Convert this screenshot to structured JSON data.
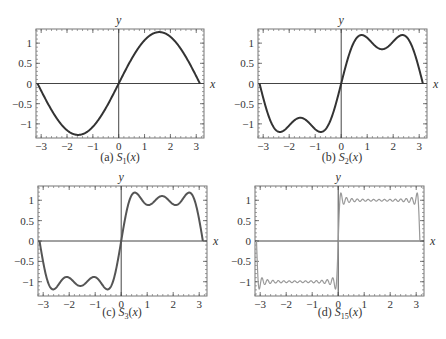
{
  "figure": {
    "panels": [
      {
        "id": "a",
        "caption_prefix": "(a) ",
        "func": "S",
        "sub": "1",
        "arg": "(x)"
      },
      {
        "id": "b",
        "caption_prefix": "(b) ",
        "func": "S",
        "sub": "2",
        "arg": "(x)"
      },
      {
        "id": "c",
        "caption_prefix": "(c) ",
        "func": "S",
        "sub": "3",
        "arg": "(x)"
      },
      {
        "id": "d",
        "caption_prefix": "(d) ",
        "func": "S",
        "sub": "15",
        "arg": "(x)"
      }
    ]
  },
  "chart_data": [
    {
      "type": "line",
      "title": "(a) S1(x)",
      "xlabel": "x",
      "ylabel": "y",
      "xlim": [
        -3.2,
        3.3
      ],
      "ylim": [
        -1.35,
        1.35
      ],
      "xticks": [
        -3,
        -2,
        -1,
        0,
        1,
        2,
        3
      ],
      "yticks": [
        -1,
        -0.5,
        0,
        0.5,
        1
      ],
      "ytick_labels": [
        "−1",
        "−0.5",
        "0",
        "0.5",
        "1"
      ],
      "xtick_labels": [
        "−3",
        "−2",
        "−1",
        "0",
        "1",
        "2",
        "3"
      ],
      "terms": 1,
      "formula": "(4/π) Σ_{k=1..n} sin((2k−1)x)/(2k−1)",
      "x_domain": [
        -3.14159,
        3.14159
      ],
      "key_points": [
        [
          -3.14,
          0
        ],
        [
          -1.57,
          -1.27
        ],
        [
          0,
          0
        ],
        [
          1.57,
          1.27
        ],
        [
          3.14,
          0
        ]
      ],
      "stroke": "#333333"
    },
    {
      "type": "line",
      "title": "(b) S2(x)",
      "xlabel": "x",
      "ylabel": "y",
      "xlim": [
        -3.2,
        3.3
      ],
      "ylim": [
        -1.35,
        1.35
      ],
      "xticks": [
        -3,
        -2,
        -1,
        0,
        1,
        2,
        3
      ],
      "yticks": [
        -1,
        -0.5,
        0,
        0.5,
        1
      ],
      "ytick_labels": [
        "−1",
        "−0.5",
        "0",
        "0.5",
        "1"
      ],
      "xtick_labels": [
        "−3",
        "−2",
        "−1",
        "0",
        "1",
        "2",
        "3"
      ],
      "terms": 2,
      "x_domain": [
        -3.14159,
        3.14159
      ],
      "key_points": [
        [
          -2.36,
          -1.2
        ],
        [
          -1.57,
          -0.85
        ],
        [
          -0.79,
          -1.2
        ],
        [
          0,
          0
        ],
        [
          0.79,
          1.2
        ],
        [
          1.57,
          0.85
        ],
        [
          2.36,
          1.2
        ]
      ],
      "stroke": "#333333"
    },
    {
      "type": "line",
      "title": "(c) S3(x)",
      "xlabel": "x",
      "ylabel": "y",
      "xlim": [
        -3.2,
        3.3
      ],
      "ylim": [
        -1.35,
        1.35
      ],
      "xticks": [
        -3,
        -2,
        -1,
        0,
        1,
        2,
        3
      ],
      "yticks": [
        -1,
        -0.5,
        0,
        0.5,
        1
      ],
      "ytick_labels": [
        "−1",
        "−0.5",
        "0",
        "0.5",
        "1"
      ],
      "xtick_labels": [
        "−3",
        "−2",
        "−1",
        "0",
        "1",
        "2",
        "3"
      ],
      "terms": 3,
      "x_domain": [
        -3.14159,
        3.14159
      ],
      "key_points": [
        [
          -2.62,
          -1.18
        ],
        [
          -2.09,
          -0.9
        ],
        [
          -1.57,
          -1.1
        ],
        [
          -1.05,
          -0.9
        ],
        [
          -0.52,
          -1.18
        ],
        [
          0,
          0
        ],
        [
          0.52,
          1.18
        ],
        [
          1.05,
          0.9
        ],
        [
          1.57,
          1.1
        ],
        [
          2.09,
          0.9
        ],
        [
          2.62,
          1.18
        ]
      ],
      "stroke": "#555555"
    },
    {
      "type": "line",
      "title": "(d) S15(x)",
      "xlabel": "x",
      "ylabel": "y",
      "xlim": [
        -3.2,
        3.3
      ],
      "ylim": [
        -1.35,
        1.35
      ],
      "xticks": [
        -3,
        -2,
        -1,
        0,
        1,
        2,
        3
      ],
      "yticks": [
        -1,
        -0.5,
        0,
        0.5,
        1
      ],
      "ytick_labels": [
        "−1",
        "−0.5",
        "0",
        "0.5",
        "1"
      ],
      "xtick_labels": [
        "−3",
        "−2",
        "−1",
        "0",
        "1",
        "2",
        "3"
      ],
      "terms": 15,
      "x_domain": [
        -3.14159,
        3.14159
      ],
      "key_points": [
        [
          -3.04,
          -1.18
        ],
        [
          -1.57,
          -1.0
        ],
        [
          -0.1,
          -1.18
        ],
        [
          0,
          0
        ],
        [
          0.1,
          1.18
        ],
        [
          1.57,
          1.0
        ],
        [
          3.04,
          1.18
        ]
      ],
      "stroke": "#999999"
    }
  ],
  "layout": {
    "frames": [
      {
        "left": 36,
        "right": 204,
        "top": 29,
        "bottom": 138,
        "caption_y": 161,
        "caption_x": 120
      },
      {
        "left": 258,
        "right": 427,
        "top": 29,
        "bottom": 138,
        "caption_y": 161,
        "caption_x": 342
      },
      {
        "left": 38,
        "right": 207,
        "top": 186,
        "bottom": 296,
        "caption_y": 316,
        "caption_x": 122
      },
      {
        "left": 255,
        "right": 424,
        "top": 186,
        "bottom": 296,
        "caption_y": 316,
        "caption_x": 340
      }
    ]
  }
}
